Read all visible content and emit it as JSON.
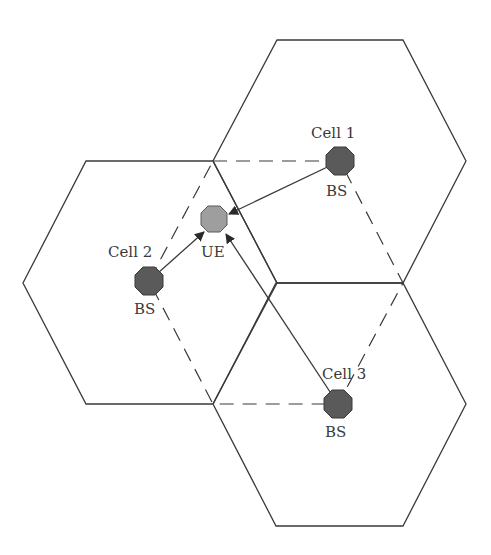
{
  "diagram": {
    "type": "cellular-network",
    "colors": {
      "line": "#3a3a3a",
      "bs_fill": "#5a5a5a",
      "ue_fill": "#9e9e9e",
      "background": "#ffffff"
    },
    "cells": [
      {
        "id": "cell1",
        "label": "Cell 1",
        "bs_label": "BS",
        "center": [
          340,
          161
        ],
        "points": "277,40 403,40 466,161 403,283 277,283 213,161"
      },
      {
        "id": "cell2",
        "label": "Cell 2",
        "bs_label": "BS",
        "center": [
          149,
          281
        ],
        "points": "86,161 213,161 277,283 213,404 86,404 23,283"
      },
      {
        "id": "cell3",
        "label": "Cell 3",
        "bs_label": "BS",
        "center": [
          338,
          404
        ],
        "points": "276,283 403,283 466,404 403,526 276,526 213,404"
      }
    ],
    "ue": {
      "label": "UE",
      "center": [
        214,
        219
      ]
    },
    "dashed_outline": "213,161 340,161 403,283 338,404 213,404 149,281"
  }
}
